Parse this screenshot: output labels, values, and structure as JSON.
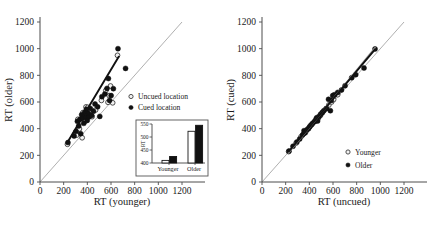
{
  "figure": {
    "panels": [
      {
        "id": "left",
        "xlabel": "RT (younger)",
        "ylabel": "RT (older)",
        "xticks": [
          0,
          200,
          400,
          600,
          800,
          1000,
          1200
        ],
        "yticks": [
          0,
          200,
          400,
          600,
          800,
          1000,
          1200
        ],
        "legend": [
          {
            "label": "Uncued location",
            "marker": "open-circle"
          },
          {
            "label": "Cued location",
            "marker": "filled-circle"
          }
        ]
      },
      {
        "id": "right",
        "xlabel": "RT (uncued)",
        "ylabel": "RT (cued)",
        "xticks": [
          0,
          200,
          400,
          600,
          800,
          1000,
          1200
        ],
        "yticks": [
          0,
          200,
          400,
          600,
          800,
          1000,
          1200
        ],
        "legend": [
          {
            "label": "Younger",
            "marker": "open-circle"
          },
          {
            "label": "Older",
            "marker": "filled-circle"
          }
        ]
      }
    ]
  },
  "chart_data": [
    {
      "type": "scatter",
      "id": "left-panel",
      "title": "",
      "xlabel": "RT (younger)",
      "ylabel": "RT (older)",
      "xlim": [
        0,
        1200
      ],
      "ylim": [
        0,
        1200
      ],
      "xticks": [
        0,
        200,
        400,
        600,
        800,
        1000,
        1200
      ],
      "yticks": [
        0,
        200,
        400,
        600,
        800,
        1000,
        1200
      ],
      "grid": false,
      "legend_position": "right-middle",
      "annotations": [
        "diagonal unity line y = x",
        "linear fit through data"
      ],
      "reference_line": {
        "name": "unity",
        "slope": 1,
        "intercept": 0
      },
      "fit_line": {
        "x": [
          230,
          665
        ],
        "y": [
          295,
          940
        ]
      },
      "series": [
        {
          "name": "Uncued location",
          "marker": "open-circle",
          "points": [
            [
              232,
              283
            ],
            [
              300,
              368
            ],
            [
              311,
              352
            ],
            [
              320,
              470
            ],
            [
              333,
              398
            ],
            [
              347,
              452
            ],
            [
              356,
              332
            ],
            [
              362,
              520
            ],
            [
              381,
              455
            ],
            [
              389,
              563
            ],
            [
              396,
              487
            ],
            [
              404,
              560
            ],
            [
              422,
              503
            ],
            [
              440,
              490
            ],
            [
              470,
              540
            ],
            [
              519,
              612
            ],
            [
              556,
              686
            ],
            [
              575,
              598
            ],
            [
              585,
              648
            ],
            [
              596,
              720
            ],
            [
              614,
              594
            ],
            [
              655,
              950
            ]
          ]
        },
        {
          "name": "Cued location",
          "marker": "filled-circle",
          "points": [
            [
              236,
              296
            ],
            [
              288,
              345
            ],
            [
              305,
              380
            ],
            [
              316,
              455
            ],
            [
              327,
              420
            ],
            [
              338,
              470
            ],
            [
              344,
              362
            ],
            [
              352,
              505
            ],
            [
              358,
              478
            ],
            [
              370,
              440
            ],
            [
              377,
              522
            ],
            [
              384,
              488
            ],
            [
              392,
              545
            ],
            [
              399,
              462
            ],
            [
              408,
              515
            ],
            [
              414,
              488
            ],
            [
              425,
              552
            ],
            [
              437,
              498
            ],
            [
              452,
              530
            ],
            [
              465,
              585
            ],
            [
              487,
              564
            ],
            [
              505,
              492
            ],
            [
              523,
              640
            ],
            [
              548,
              660
            ],
            [
              566,
              702
            ],
            [
              578,
              776
            ],
            [
              588,
              612
            ],
            [
              601,
              648
            ],
            [
              620,
              700
            ],
            [
              659,
              1000
            ],
            [
              723,
              852
            ]
          ]
        }
      ],
      "inset": {
        "type": "bar",
        "ylabel": "RT",
        "ylim": [
          400,
          550
        ],
        "yticks": [
          400,
          450,
          500,
          550
        ],
        "categories": [
          "Younger",
          "Older"
        ],
        "series": [
          {
            "name": "Uncued location",
            "marker": "open-bar",
            "values": [
              410,
              522
            ]
          },
          {
            "name": "Cued location",
            "marker": "filled-bar",
            "values": [
              425,
              545
            ]
          }
        ]
      }
    },
    {
      "type": "scatter",
      "id": "right-panel",
      "title": "",
      "xlabel": "RT (uncued)",
      "ylabel": "RT (cued)",
      "xlim": [
        0,
        1200
      ],
      "ylim": [
        0,
        1200
      ],
      "xticks": [
        0,
        200,
        400,
        600,
        800,
        1000,
        1200
      ],
      "yticks": [
        0,
        200,
        400,
        600,
        800,
        1000,
        1200
      ],
      "grid": false,
      "legend_position": "lower-right",
      "annotations": [
        "diagonal unity line y = x",
        "linear fit through data"
      ],
      "reference_line": {
        "name": "unity",
        "slope": 1,
        "intercept": 0
      },
      "fit_line": {
        "x": [
          225,
          955
        ],
        "y": [
          228,
          995
        ]
      },
      "series": [
        {
          "name": "Younger",
          "marker": "open-circle",
          "points": [
            [
              225,
              228
            ],
            [
              288,
              292
            ],
            [
              330,
              340
            ],
            [
              352,
              362
            ],
            [
              368,
              372
            ],
            [
              388,
              398
            ],
            [
              405,
              418
            ],
            [
              420,
              430
            ],
            [
              448,
              455
            ],
            [
              462,
              470
            ],
            [
              478,
              482
            ],
            [
              495,
              500
            ],
            [
              512,
              522
            ],
            [
              540,
              548
            ],
            [
              565,
              578
            ],
            [
              588,
              600
            ],
            [
              605,
              618
            ],
            [
              640,
              655
            ]
          ]
        },
        {
          "name": "Older",
          "marker": "filled-circle",
          "points": [
            [
              228,
              232
            ],
            [
              262,
              268
            ],
            [
              295,
              300
            ],
            [
              318,
              322
            ],
            [
              342,
              352
            ],
            [
              355,
              385
            ],
            [
              362,
              368
            ],
            [
              378,
              390
            ],
            [
              392,
              400
            ],
            [
              402,
              412
            ],
            [
              415,
              428
            ],
            [
              428,
              440
            ],
            [
              442,
              452
            ],
            [
              455,
              468
            ],
            [
              462,
              482
            ],
            [
              470,
              458
            ],
            [
              482,
              492
            ],
            [
              495,
              508
            ],
            [
              508,
              520
            ],
            [
              522,
              535
            ],
            [
              545,
              552
            ],
            [
              562,
              620
            ],
            [
              578,
              535
            ],
            [
              585,
              612
            ],
            [
              598,
              648
            ],
            [
              612,
              655
            ],
            [
              640,
              672
            ],
            [
              672,
              690
            ],
            [
              702,
              722
            ],
            [
              758,
              782
            ],
            [
              792,
              805
            ],
            [
              862,
              855
            ],
            [
              955,
              998
            ]
          ]
        }
      ]
    }
  ]
}
